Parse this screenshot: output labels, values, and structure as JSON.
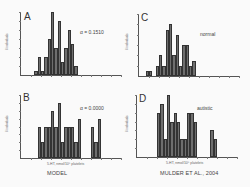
{
  "chart_data": [
    {
      "panel": "A",
      "type": "bar",
      "title": "",
      "annotation": "α = 0.1510",
      "xlabel": "5-HT, nmol/10⁹ platelets",
      "ylabel": "# individuals",
      "xlim": [
        0,
        10
      ],
      "ylim": [
        0,
        14
      ],
      "bin_width": 0.33,
      "x": [
        1.5,
        1.83,
        2.17,
        2.5,
        2.83,
        3.17,
        3.5,
        3.83,
        4.17,
        4.5,
        4.83,
        5.17,
        5.5
      ],
      "values": [
        1,
        4,
        1,
        4,
        8,
        14,
        6,
        12,
        3,
        6,
        10,
        7,
        2
      ]
    },
    {
      "panel": "B",
      "type": "bar",
      "annotation": "α = 0.0000",
      "xlabel": "5-HT, nmol/10⁹ platelets",
      "ylabel": "# individuals",
      "xlim": [
        0,
        10
      ],
      "ylim": [
        0,
        8
      ],
      "bin_width": 0.33,
      "x": [
        1.83,
        2.17,
        2.5,
        2.83,
        3.17,
        3.5,
        3.83,
        4.17,
        4.5,
        4.83,
        5.17,
        5.5,
        5.83,
        6.17,
        6.5,
        6.83,
        7.17,
        7.5,
        7.83
      ],
      "values": [
        4,
        2,
        4,
        4,
        6,
        4,
        7,
        2,
        4,
        4,
        4,
        2,
        5,
        0,
        0,
        0,
        4,
        2,
        5
      ]
    },
    {
      "panel": "C",
      "type": "bar",
      "annotation": "normal",
      "xlabel": "5-HT, nmol/10⁹ platelets",
      "ylabel": "# individuals",
      "xlim": [
        0,
        10
      ],
      "ylim": [
        0,
        12
      ],
      "bin_width": 0.33,
      "x": [
        0.83,
        1.17,
        1.5,
        1.83,
        2.17,
        2.5,
        2.83,
        3.17,
        3.5,
        3.83,
        4.17,
        4.5,
        4.83,
        5.17,
        5.5
      ],
      "values": [
        1,
        1,
        0,
        2,
        4,
        2,
        9,
        10,
        4,
        8,
        2,
        6,
        6,
        2,
        3
      ]
    },
    {
      "panel": "D",
      "type": "bar",
      "annotation": "autistic",
      "xlabel": "5-HT, nmol/10⁹ platelets",
      "ylabel": "# individuals",
      "xlim": [
        0,
        10
      ],
      "ylim": [
        0,
        7
      ],
      "bin_width": 0.33,
      "x": [
        2.17,
        2.5,
        2.83,
        3.17,
        3.5,
        3.83,
        4.17,
        4.5,
        4.83,
        5.17,
        5.5,
        5.83,
        6.17,
        6.5,
        6.83,
        7.17,
        7.5,
        7.83
      ],
      "values": [
        5,
        6,
        2,
        7,
        4,
        5,
        4,
        2,
        2,
        5,
        5,
        4,
        0,
        0,
        0,
        0,
        3,
        2
      ]
    }
  ],
  "captions": {
    "left": "MODEL",
    "right": "MULDER ET AL., 2004"
  },
  "panels": {
    "A": {
      "letter": "A",
      "annotation": "α = 0.1510"
    },
    "B": {
      "letter": "B",
      "annotation": "α = 0.0000"
    },
    "C": {
      "letter": "C",
      "annotation": "normal"
    },
    "D": {
      "letter": "D",
      "annotation": "autistic"
    }
  },
  "axis": {
    "xlabel": "5-HT, nmol/10⁹ platelets",
    "ylabel": "# individuals"
  },
  "colors": {
    "bar": "#6e6e6e",
    "axis": "#555555",
    "background": "#fafafa"
  }
}
